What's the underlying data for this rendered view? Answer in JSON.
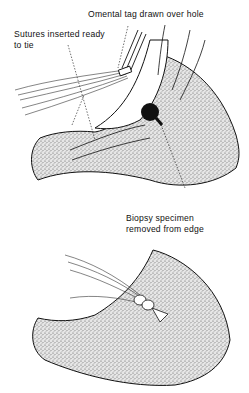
{
  "figure": {
    "top_panel": {
      "labels": {
        "omental_tag": "Omental tag drawn over hole",
        "sutures_line1": "Sutures inserted ready",
        "sutures_line2": "to tie",
        "biopsy_line1": "Biopsy specimen",
        "biopsy_line2": "removed from edge"
      }
    },
    "bottom_panel": {
      "description": "Sutures tied over omental tag"
    },
    "colors": {
      "ink": "#111111",
      "background": "#ffffff",
      "stipple": "#9a9a9a"
    }
  }
}
